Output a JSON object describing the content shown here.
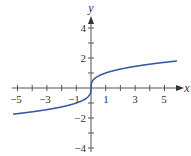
{
  "chart_data": {
    "type": "line",
    "title": "",
    "function": "y = cbrt(x)",
    "xlabel": "x",
    "ylabel": "y",
    "xlim": [
      -5.3,
      6.2
    ],
    "ylim": [
      -4.3,
      4.8
    ],
    "x_ticks": [
      -5,
      -4,
      -3,
      -2,
      -1,
      1,
      2,
      3,
      4,
      5
    ],
    "x_tick_labels": [
      "-5",
      "-3",
      "-1",
      "1",
      "3",
      "5"
    ],
    "x_tick_label_values": [
      -5,
      -3,
      -1,
      1,
      3,
      5
    ],
    "y_ticks": [
      -4,
      -3,
      -2,
      -1,
      1,
      2,
      3,
      4
    ],
    "y_tick_labels": [
      "4",
      "2",
      "-2",
      "-4"
    ],
    "y_tick_label_values": [
      4,
      2,
      -2,
      -4
    ],
    "grid": false,
    "legend": null,
    "series": [
      {
        "name": "cube root",
        "color": "#3a5aa8",
        "x": [
          -5.3,
          -4,
          -3,
          -2,
          -1,
          -0.5,
          -0.1,
          -0.01,
          0,
          0.01,
          0.1,
          0.5,
          1,
          2,
          3,
          4,
          5,
          5.85
        ],
        "y": [
          -1.74,
          -1.59,
          -1.44,
          -1.26,
          -1.0,
          -0.79,
          -0.46,
          -0.22,
          0,
          0.22,
          0.46,
          0.79,
          1.0,
          1.26,
          1.44,
          1.59,
          1.71,
          1.8
        ]
      }
    ]
  },
  "labels": {
    "x_axis": "x",
    "y_axis": "y",
    "xt": [
      "−5",
      "−3",
      "−1",
      "1",
      "3",
      "5"
    ],
    "yt": [
      "4",
      "2",
      "−2",
      "−4"
    ]
  }
}
